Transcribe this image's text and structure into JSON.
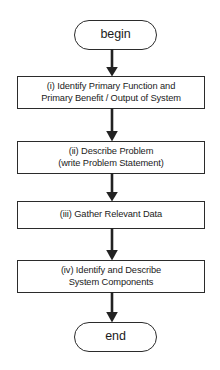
{
  "diagram": {
    "type": "flowchart",
    "orientation": "vertical",
    "background_color": "#ffffff",
    "stroke_color": "#2b2b2b",
    "text_color": "#1b1b1b",
    "nodes": [
      {
        "id": "begin",
        "shape": "terminal",
        "label": "begin"
      },
      {
        "id": "step-1",
        "shape": "process",
        "label": "(i) Identify Primary Function and\nPrimary Benefit / Output of System"
      },
      {
        "id": "step-2",
        "shape": "process",
        "label": "(ii) Describe Problem\n(write Problem Statement)"
      },
      {
        "id": "step-3",
        "shape": "process",
        "label": "(iii) Gather Relevant Data"
      },
      {
        "id": "step-4",
        "shape": "process",
        "label": "(iv) Identify and Describe\nSystem Components"
      },
      {
        "id": "end",
        "shape": "terminal",
        "label": "end"
      }
    ],
    "edges": [
      {
        "from": "begin",
        "to": "step-1",
        "style": "arrow-down"
      },
      {
        "from": "step-1",
        "to": "step-2",
        "style": "arrow-down"
      },
      {
        "from": "step-2",
        "to": "step-3",
        "style": "arrow-down"
      },
      {
        "from": "step-3",
        "to": "step-4",
        "style": "arrow-down"
      },
      {
        "from": "step-4",
        "to": "end",
        "style": "arrow-down"
      }
    ]
  }
}
